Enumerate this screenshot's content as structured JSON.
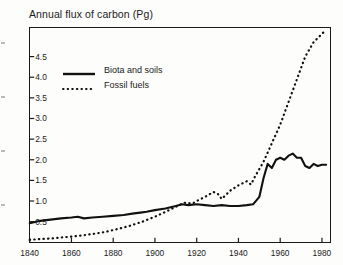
{
  "chart_data": {
    "type": "line",
    "title": "Annual flux of carbon (Pg)",
    "xlabel": "",
    "ylabel": "",
    "xlim": [
      1840,
      1984
    ],
    "ylim": [
      0.0,
      5.2
    ],
    "xticks": [
      1840,
      1860,
      1880,
      1900,
      1920,
      1940,
      1960,
      1980
    ],
    "yticks": [
      0.5,
      1.0,
      1.5,
      2.0,
      2.5,
      3.0,
      3.5,
      4.0,
      4.5
    ],
    "xtick_labels": [
      "1840",
      "1860",
      "1880",
      "1900",
      "1920",
      "1940",
      "1960",
      "1980"
    ],
    "ytick_labels": [
      "0.5",
      "1.0",
      "1.5",
      "2.0",
      "2.5",
      "3.0",
      "3.5",
      "4.0",
      "4.5"
    ],
    "grid": false,
    "legend_position": "upper-left-inside",
    "series": [
      {
        "name": "Biota and soils",
        "style": "solid",
        "color": "#111111",
        "x": [
          1840,
          1845,
          1850,
          1855,
          1860,
          1863,
          1866,
          1870,
          1875,
          1880,
          1885,
          1890,
          1893,
          1896,
          1900,
          1905,
          1910,
          1913,
          1916,
          1920,
          1924,
          1928,
          1932,
          1936,
          1940,
          1944,
          1947,
          1950,
          1952,
          1954,
          1956,
          1958,
          1960,
          1962,
          1964,
          1966,
          1968,
          1970,
          1972,
          1974,
          1976,
          1978,
          1980,
          1982
        ],
        "values": [
          0.46,
          0.52,
          0.55,
          0.58,
          0.6,
          0.62,
          0.58,
          0.6,
          0.62,
          0.64,
          0.66,
          0.7,
          0.72,
          0.74,
          0.78,
          0.82,
          0.88,
          0.92,
          0.9,
          0.92,
          0.9,
          0.88,
          0.9,
          0.88,
          0.88,
          0.9,
          0.92,
          1.1,
          1.55,
          1.9,
          1.8,
          2.0,
          2.05,
          2.0,
          2.1,
          2.15,
          2.05,
          2.05,
          1.85,
          1.8,
          1.9,
          1.85,
          1.88,
          1.88
        ]
      },
      {
        "name": "Fossil fuels",
        "style": "dotted",
        "color": "#111111",
        "x": [
          1840,
          1846,
          1852,
          1858,
          1864,
          1870,
          1876,
          1882,
          1888,
          1894,
          1900,
          1906,
          1910,
          1914,
          1918,
          1920,
          1924,
          1928,
          1930,
          1932,
          1936,
          1940,
          1944,
          1946,
          1948,
          1952,
          1956,
          1960,
          1964,
          1968,
          1972,
          1976,
          1980,
          1982
        ],
        "values": [
          0.06,
          0.08,
          0.1,
          0.13,
          0.16,
          0.2,
          0.25,
          0.32,
          0.4,
          0.5,
          0.62,
          0.76,
          0.86,
          0.96,
          0.94,
          1.0,
          1.1,
          1.22,
          1.18,
          1.05,
          1.25,
          1.38,
          1.48,
          1.4,
          1.6,
          1.95,
          2.4,
          2.85,
          3.4,
          3.95,
          4.5,
          4.85,
          5.05,
          5.15
        ]
      }
    ]
  },
  "legend": {
    "items": [
      {
        "label": "Biota and soils",
        "style": "solid"
      },
      {
        "label": "Fossil fuels",
        "style": "dotted"
      }
    ]
  }
}
